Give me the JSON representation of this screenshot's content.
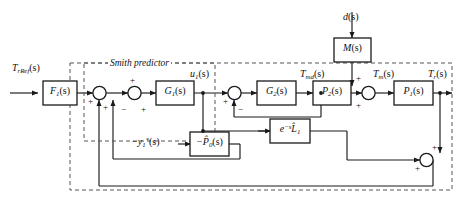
{
  "diagram": {
    "annotation": "Smith predictor",
    "colors": {
      "line": "#1a1a1a",
      "block_border": "#1a1a1a",
      "block_fill": "#ffffff",
      "dashed": "#555555",
      "background": "#ffffff"
    }
  },
  "signals": {
    "reference_input": "T",
    "reference_input_sub": "rRef",
    "reference_input_arg": "(s)",
    "control_signal": "u",
    "control_signal_sub": "1",
    "control_signal_arg": "(s)",
    "motor_demand": "T",
    "motor_demand_sub": "md",
    "motor_demand_arg": "(s)",
    "motor_torque": "T",
    "motor_torque_sub": "m",
    "motor_torque_arg": "(s)",
    "output": "T",
    "output_sub": "r",
    "output_arg": "(s)",
    "disturbance": "d",
    "disturbance_arg": "(s)",
    "predictor_feedback": "−y",
    "predictor_feedback_sub": "1",
    "predictor_feedback_sup": "*",
    "predictor_feedback_arg": "(s)"
  },
  "blocks": [
    {
      "id": "F1",
      "name": "filter-block",
      "label": "F",
      "sub": "1",
      "arg": "(s)"
    },
    {
      "id": "G1",
      "name": "controller-block",
      "label": "G",
      "sub": "1",
      "arg": "(s)"
    },
    {
      "id": "G2",
      "name": "inner-controller-block",
      "label": "G",
      "sub": "2",
      "arg": "(s)"
    },
    {
      "id": "P2",
      "name": "plant2-block",
      "label": "P",
      "sub": "2",
      "arg": "(s)"
    },
    {
      "id": "P1",
      "name": "plant1-block",
      "label": "P",
      "sub": "1",
      "arg": "(s)"
    },
    {
      "id": "M",
      "name": "disturbance-model-block",
      "label": "M",
      "sub": "",
      "arg": "(s)"
    },
    {
      "id": "P0hat",
      "name": "model-plant-block",
      "label": "−P̂",
      "sub": "0",
      "arg": "(s)"
    },
    {
      "id": "delay",
      "name": "delay-block",
      "label": "e",
      "sup": "−s",
      "extra": "L̂",
      "sub": "1",
      "arg": ""
    }
  ],
  "junctions": [
    {
      "id": "sum1",
      "name": "summing-junction-1",
      "signs": [
        "+",
        "+"
      ]
    },
    {
      "id": "sum2",
      "name": "summing-junction-2",
      "signs": [
        "+",
        "−",
        "+"
      ]
    },
    {
      "id": "sum3",
      "name": "summing-junction-3",
      "signs": [
        "+",
        "−"
      ]
    },
    {
      "id": "sum4",
      "name": "summing-junction-4",
      "signs": [
        "+",
        "+"
      ]
    },
    {
      "id": "sum5",
      "name": "summing-junction-5",
      "signs": [
        "+",
        "+"
      ]
    }
  ],
  "signs": {
    "plus": "+",
    "minus": "−"
  }
}
